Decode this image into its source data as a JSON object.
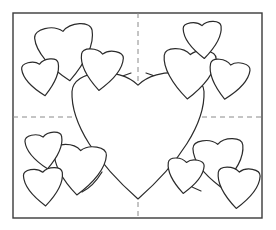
{
  "document": {
    "title": "Hearts Coloring Page",
    "kind": "line-art-coloring-page",
    "width": 276,
    "height": 230,
    "background_color": "#ffffff"
  },
  "style": {
    "outline_color": "#2b2b2b",
    "outline_width": 1.2,
    "frame_color": "#3a3a3a",
    "frame_width": 1.4,
    "guide_color": "#8a8a8a",
    "guide_width": 1,
    "guide_dash": "5 4",
    "fill_color": "#ffffff"
  },
  "frame": {
    "name": "page-border",
    "x": 13,
    "y": 13,
    "width": 249,
    "height": 205
  },
  "guides": {
    "horizontal": {
      "name": "horizontal-fold-guide",
      "y": 117,
      "x1": 13,
      "x2": 262
    },
    "vertical": {
      "name": "vertical-fold-guide",
      "x": 138,
      "y1": 13,
      "y2": 218
    }
  },
  "center_heart": {
    "name": "center-heart",
    "cx": 138,
    "cy": 135,
    "width": 132,
    "height": 128,
    "rotation": 0
  },
  "stems": [
    {
      "name": "stem-top-left",
      "d": "M 96 104 C 104 86, 118 77, 131 73"
    },
    {
      "name": "stem-top-right",
      "d": "M 181 100 C 173 85, 160 77, 146 73"
    },
    {
      "name": "stem-bottom-left",
      "d": "M 102 172 C 96 182, 90 188, 82 192"
    },
    {
      "name": "stem-bottom-right",
      "d": "M 176 172 C 183 182, 192 188, 201 191"
    }
  ],
  "clusters": [
    {
      "name": "cluster-top-left",
      "label": "Top-left heart cluster",
      "hearts": [
        {
          "name": "heart-top-left-large",
          "cx": 66,
          "cy": 53,
          "width": 58,
          "height": 56,
          "rotation": -8
        },
        {
          "name": "heart-top-left-medium",
          "cx": 101,
          "cy": 70,
          "width": 42,
          "height": 41,
          "rotation": 6
        },
        {
          "name": "heart-top-left-small",
          "cx": 42,
          "cy": 78,
          "width": 37,
          "height": 36,
          "rotation": -10
        }
      ]
    },
    {
      "name": "cluster-top-right",
      "label": "Top-right heart cluster",
      "hearts": [
        {
          "name": "heart-top-right-large",
          "cx": 189,
          "cy": 74,
          "width": 52,
          "height": 50,
          "rotation": 4
        },
        {
          "name": "heart-top-right-top",
          "cx": 203,
          "cy": 40,
          "width": 38,
          "height": 37,
          "rotation": -4
        },
        {
          "name": "heart-top-right-side",
          "cx": 228,
          "cy": 80,
          "width": 40,
          "height": 39,
          "rotation": 10
        }
      ]
    },
    {
      "name": "cluster-bottom-left",
      "label": "Bottom-left heart cluster",
      "hearts": [
        {
          "name": "heart-bottom-left-large",
          "cx": 79,
          "cy": 170,
          "width": 52,
          "height": 50,
          "rotation": 5
        },
        {
          "name": "heart-bottom-left-upper",
          "cx": 45,
          "cy": 151,
          "width": 37,
          "height": 36,
          "rotation": -8
        },
        {
          "name": "heart-bottom-left-lower",
          "cx": 44,
          "cy": 187,
          "width": 39,
          "height": 38,
          "rotation": -5
        }
      ]
    },
    {
      "name": "cluster-bottom-right",
      "label": "Bottom-right heart cluster",
      "hearts": [
        {
          "name": "heart-bottom-right-large",
          "cx": 219,
          "cy": 163,
          "width": 50,
          "height": 48,
          "rotation": -4
        },
        {
          "name": "heart-bottom-right-small",
          "cx": 185,
          "cy": 176,
          "width": 36,
          "height": 35,
          "rotation": 6
        },
        {
          "name": "heart-bottom-right-lower",
          "cx": 238,
          "cy": 188,
          "width": 42,
          "height": 41,
          "rotation": 5
        }
      ]
    }
  ],
  "counts": {
    "total_hearts": 13,
    "cluster_count": 4,
    "hearts_per_cluster": 3
  }
}
